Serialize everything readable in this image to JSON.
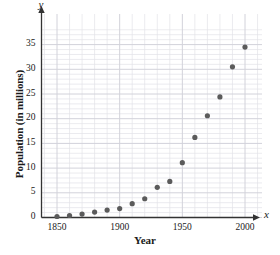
{
  "chart_data": {
    "type": "scatter",
    "title": "",
    "xlabel": "Year",
    "ylabel": "Population (in millions)",
    "x_axis_letter": "x",
    "y_axis_letter": "y",
    "xlim": [
      1840,
      2010
    ],
    "ylim": [
      0,
      38
    ],
    "xticks": [
      1850,
      1900,
      1950,
      2000
    ],
    "yticks": [
      0,
      5,
      10,
      15,
      20,
      25,
      30,
      35
    ],
    "xtick_labels": [
      "1850",
      "1900",
      "1950",
      "2000"
    ],
    "ytick_labels": [
      "0",
      "5",
      "10",
      "15",
      "20",
      "25",
      "30",
      "35"
    ],
    "x_minor_step": 10,
    "y_minor_step": 1,
    "grid": true,
    "grid_color": "#e3e3e8",
    "grid_major_color": "#d2d2da",
    "axis_color": "#333333",
    "marker_color": "#5b5b5b",
    "marker_size": 4,
    "legend": null,
    "x": [
      1850,
      1860,
      1870,
      1880,
      1890,
      1900,
      1910,
      1920,
      1930,
      1940,
      1950,
      1960,
      1970,
      1980,
      1990,
      2000
    ],
    "y": [
      0.2,
      0.4,
      0.7,
      1.1,
      1.5,
      1.8,
      2.8,
      3.8,
      6.1,
      7.3,
      11.1,
      16.2,
      20.6,
      24.4,
      30.5,
      34.5
    ],
    "points": [
      {
        "year": 1850,
        "population": 0.2
      },
      {
        "year": 1860,
        "population": 0.4
      },
      {
        "year": 1870,
        "population": 0.7
      },
      {
        "year": 1880,
        "population": 1.1
      },
      {
        "year": 1890,
        "population": 1.5
      },
      {
        "year": 1900,
        "population": 1.8
      },
      {
        "year": 1910,
        "population": 2.8
      },
      {
        "year": 1920,
        "population": 3.8
      },
      {
        "year": 1930,
        "population": 6.1
      },
      {
        "year": 1940,
        "population": 7.3
      },
      {
        "year": 1950,
        "population": 11.1
      },
      {
        "year": 1960,
        "population": 16.2
      },
      {
        "year": 1970,
        "population": 20.6
      },
      {
        "year": 1980,
        "population": 24.4
      },
      {
        "year": 1990,
        "population": 30.5
      },
      {
        "year": 2000,
        "population": 34.5
      }
    ]
  }
}
